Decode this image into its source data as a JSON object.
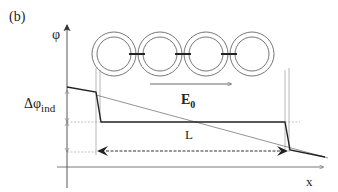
{
  "figure": {
    "panel_label": "(b)",
    "y_axis_label": "φ",
    "x_axis_label": "x",
    "field_label_main": "E",
    "field_label_sub": "0",
    "delta_label_main": "Δφ",
    "delta_label_sub": "ind",
    "length_label": "L",
    "ring_count": 5,
    "colors": {
      "line": "#222222",
      "guide": "#888888",
      "ring": "#666666"
    }
  }
}
